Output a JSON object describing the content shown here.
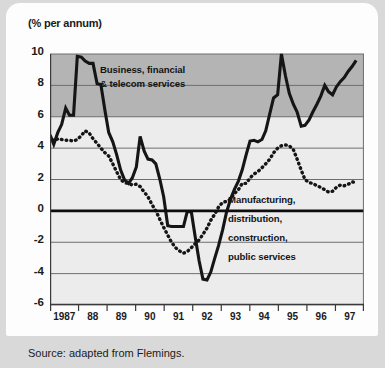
{
  "figure": {
    "unit_label": "(% per annum)",
    "source_note": "Source: adapted from Flemings."
  },
  "chart_data": {
    "type": "line",
    "title": "",
    "subtitle": "",
    "xlabel": "",
    "ylabel": "(% per annum)",
    "ylim": [
      -6,
      10
    ],
    "xlim": [
      1987,
      1997
    ],
    "grid": true,
    "grid_axis": "y",
    "legend": "none (inline series labels)",
    "ytick_labels": [
      "10",
      "8",
      "6",
      "4",
      "2",
      "0",
      "-2",
      "-4",
      "-6"
    ],
    "ytick_values": [
      10,
      8,
      6,
      4,
      2,
      0,
      -2,
      -4,
      -6
    ],
    "xtick_labels": [
      "1987",
      "88",
      "89",
      "90",
      "91",
      "92",
      "93",
      "94",
      "95",
      "96",
      "97"
    ],
    "xtick_values": [
      1987,
      1988,
      1989,
      1990,
      1991,
      1992,
      1993,
      1994,
      1995,
      1996,
      1997
    ],
    "shaded_band": {
      "from": 6,
      "to": 10,
      "color": "#b4b4b4"
    },
    "plot_background": "#ececec",
    "zero_line": 0,
    "annotations": [
      {
        "name": "business-financial-telecom-label",
        "text_lines": [
          "Business, financial",
          "& telecom services"
        ],
        "series": "Business, financial & telecom services",
        "at": {
          "x": 1988.35,
          "y": 8.7
        }
      },
      {
        "name": "manufacturing-label",
        "text_lines": [
          "Manufacturing,",
          "distribution,",
          "construction,",
          "public services"
        ],
        "series": "Manufacturing, distribution, construction, public services",
        "at": {
          "x": 1992.45,
          "y": 0.55
        }
      }
    ],
    "series": [
      {
        "name": "Business, financial & telecom services",
        "style": "solid",
        "color": "#151515",
        "width": 3.1,
        "x": [
          1987.0,
          1987.12,
          1987.25,
          1987.37,
          1987.5,
          1987.62,
          1987.75,
          1987.87,
          1988.0,
          1988.12,
          1988.25,
          1988.37,
          1988.5,
          1988.62,
          1988.75,
          1988.87,
          1989.0,
          1989.12,
          1989.25,
          1989.37,
          1989.5,
          1989.62,
          1989.75,
          1989.87,
          1990.0,
          1990.12,
          1990.25,
          1990.37,
          1990.5,
          1990.62,
          1990.75,
          1990.87,
          1991.0,
          1991.12,
          1991.25,
          1991.37,
          1991.5,
          1991.62,
          1991.75,
          1991.87,
          1992.0,
          1992.12,
          1992.25,
          1992.37,
          1992.5,
          1992.62,
          1992.75,
          1992.87,
          1993.0,
          1993.12,
          1993.25,
          1993.37,
          1993.5,
          1993.62,
          1993.75,
          1993.87,
          1994.0,
          1994.12,
          1994.25,
          1994.37,
          1994.5,
          1994.62,
          1994.75,
          1994.87,
          1995.0,
          1995.12,
          1995.25,
          1995.37,
          1995.5,
          1995.62,
          1995.75,
          1995.87,
          1996.0,
          1996.12,
          1996.25,
          1996.37,
          1996.5,
          1996.62,
          1996.75
        ],
        "y": [
          4.85,
          4.25,
          5.0,
          5.5,
          6.55,
          6.1,
          6.1,
          9.85,
          9.8,
          9.55,
          9.4,
          9.4,
          8.1,
          8.05,
          6.4,
          5.0,
          4.4,
          3.6,
          2.6,
          2.0,
          1.75,
          2.1,
          2.8,
          4.75,
          3.8,
          3.3,
          3.25,
          3.0,
          2.0,
          0.9,
          -0.95,
          -1.0,
          -1.0,
          -1.0,
          -1.0,
          -0.05,
          -0.05,
          -1.6,
          -3.2,
          -4.35,
          -4.4,
          -3.9,
          -3.0,
          -2.2,
          -1.2,
          -0.1,
          0.75,
          1.35,
          1.9,
          2.6,
          3.6,
          4.45,
          4.5,
          4.4,
          4.55,
          5.1,
          6.2,
          7.2,
          7.4,
          10.0,
          8.6,
          7.5,
          6.8,
          6.3,
          5.4,
          5.45,
          5.8,
          6.3,
          6.8,
          7.3,
          8.0,
          7.6,
          7.4,
          7.9,
          8.25,
          8.5,
          8.9,
          9.2,
          9.6
        ]
      },
      {
        "name": "Manufacturing, distribution, construction, public services",
        "style": "dotted",
        "color": "#151515",
        "width": 3.1,
        "x": [
          1987.0,
          1987.12,
          1987.25,
          1987.37,
          1987.5,
          1987.62,
          1987.75,
          1987.87,
          1988.0,
          1988.12,
          1988.25,
          1988.37,
          1988.5,
          1988.62,
          1988.75,
          1988.87,
          1989.0,
          1989.12,
          1989.25,
          1989.37,
          1989.5,
          1989.62,
          1989.75,
          1989.87,
          1990.0,
          1990.12,
          1990.25,
          1990.37,
          1990.5,
          1990.62,
          1990.75,
          1990.87,
          1991.0,
          1991.12,
          1991.25,
          1991.37,
          1991.5,
          1991.62,
          1991.75,
          1991.87,
          1992.0,
          1992.12,
          1992.25,
          1992.37,
          1992.5,
          1992.62,
          1992.75,
          1992.87,
          1993.0,
          1993.12,
          1993.25,
          1993.37,
          1993.5,
          1993.62,
          1993.75,
          1993.87,
          1994.0,
          1994.12,
          1994.25,
          1994.37,
          1994.5,
          1994.62,
          1994.75,
          1994.87,
          1995.0,
          1995.12,
          1995.25,
          1995.37,
          1995.5,
          1995.62,
          1995.75,
          1995.87,
          1996.0,
          1996.12,
          1996.25,
          1996.37,
          1996.5,
          1996.62,
          1996.75
        ],
        "y": [
          4.75,
          4.45,
          4.6,
          4.55,
          4.5,
          4.5,
          4.45,
          4.55,
          4.8,
          5.1,
          4.95,
          4.6,
          4.3,
          4.0,
          3.7,
          3.5,
          3.0,
          2.5,
          2.0,
          1.8,
          1.75,
          1.65,
          1.7,
          1.55,
          1.2,
          0.9,
          0.4,
          0.0,
          -0.55,
          -1.05,
          -1.55,
          -2.0,
          -2.35,
          -2.55,
          -2.7,
          -2.6,
          -2.35,
          -2.1,
          -1.85,
          -1.5,
          -1.1,
          -0.6,
          -0.2,
          0.25,
          0.55,
          0.6,
          0.75,
          1.1,
          1.35,
          1.75,
          1.75,
          2.1,
          2.35,
          2.5,
          2.75,
          3.0,
          3.3,
          3.7,
          4.0,
          4.15,
          4.2,
          4.15,
          3.9,
          3.3,
          2.6,
          2.0,
          1.8,
          1.75,
          1.6,
          1.5,
          1.35,
          1.2,
          1.25,
          1.5,
          1.65,
          1.6,
          1.7,
          1.85,
          1.8
        ]
      }
    ]
  }
}
